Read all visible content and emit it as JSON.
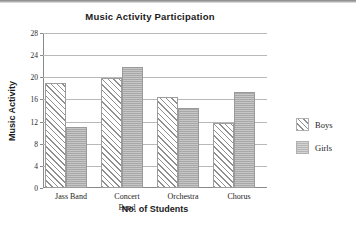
{
  "chart_data": {
    "type": "bar",
    "title": "Music Activity Participation",
    "xlabel": "No. of Students",
    "ylabel": "Music Activity",
    "categories": [
      "Jass Band",
      "Concert Band",
      "Orchestra",
      "Chorus"
    ],
    "category_lines": [
      {
        "line1": "Jass Band",
        "line2": ""
      },
      {
        "line1": "Concert",
        "line2": "Band"
      },
      {
        "line1": "Orchestra",
        "line2": ""
      },
      {
        "line1": "Chorus",
        "line2": ""
      }
    ],
    "series": [
      {
        "name": "Boys",
        "values": [
          19,
          19.8,
          16.5,
          11.7
        ],
        "fill": "diagonal-hatch",
        "color": "#8f8f8f"
      },
      {
        "name": "Girls",
        "values": [
          11,
          21.8,
          14.5,
          17.4
        ],
        "fill": "solid-gray",
        "color": "#a8a8a8"
      }
    ],
    "ylim": [
      0,
      28
    ],
    "yticks": [
      0,
      4,
      8,
      12,
      16,
      20,
      24,
      28
    ],
    "ytick_labels": [
      "0",
      "4",
      "8",
      "12",
      "16",
      "20",
      "24",
      "28"
    ],
    "grid": true,
    "legend_position": "right"
  },
  "legend": {
    "items": [
      {
        "label": "Boys"
      },
      {
        "label": "Girls"
      }
    ]
  }
}
